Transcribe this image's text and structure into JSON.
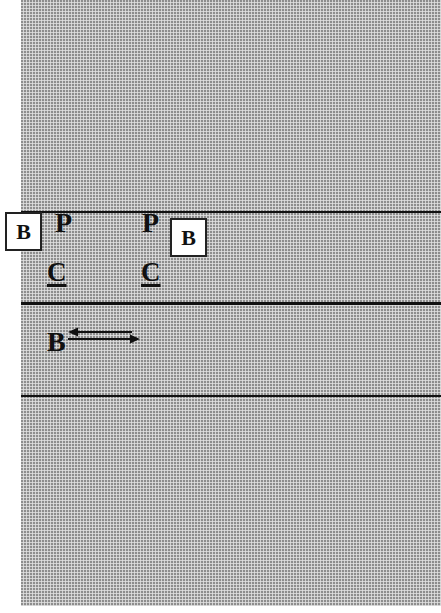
{
  "diagram": {
    "background_color": "#c4c4c4",
    "line_color": "#111111",
    "lines": [
      {
        "id": "upper",
        "y": 211,
        "weight": "thin"
      },
      {
        "id": "middle",
        "y": 302,
        "weight": "thick"
      },
      {
        "id": "lower",
        "y": 395,
        "weight": "thin"
      }
    ],
    "labels": {
      "boxed_b_left": "B",
      "boxed_b_right": "B",
      "p_left": "P",
      "p_right": "P",
      "c_left": "C",
      "c_right": "C",
      "b_moving": "B"
    },
    "arrows": {
      "upper": {
        "direction": "left"
      },
      "lower": {
        "direction": "right"
      }
    }
  }
}
